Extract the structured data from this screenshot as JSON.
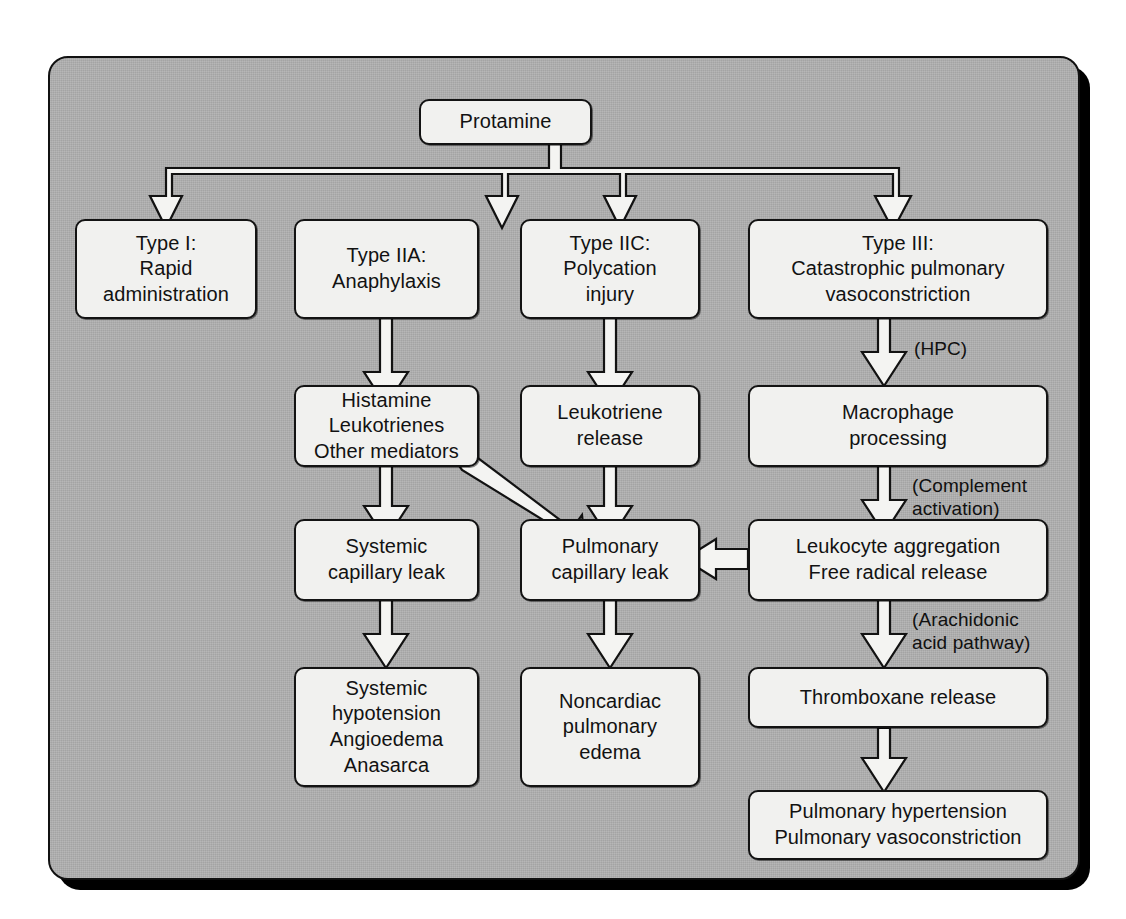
{
  "diagram": {
    "background_color": "#b0b0b0",
    "node_fill_color": "#f1f1ef",
    "line_color": "#131313"
  },
  "nodes": {
    "protamine": "Protamine",
    "type1": "Type I:\nRapid\nadministration",
    "type2a": "Type IIA:\nAnaphylaxis",
    "type2c": "Type IIC:\nPolycation\ninjury",
    "type3": "Type III:\nCatastrophic pulmonary\nvasoconstriction",
    "mediators": "Histamine\nLeukotrienes\nOther mediators",
    "leukotriene_release": "Leukotriene\nrelease",
    "macrophage": "Macrophage\nprocessing",
    "systemic_leak": "Systemic\ncapillary leak",
    "pulmonary_leak": "Pulmonary\ncapillary leak",
    "leukocyte": "Leukocyte aggregation\nFree radical release",
    "systemic_outcome": "Systemic\nhypotension\nAngioedema\nAnasarca",
    "noncardiac_edema": "Noncardiac\npulmonary\nedema",
    "thromboxane": "Thromboxane release",
    "pulmonary_outcome": "Pulmonary hypertension\nPulmonary vasoconstriction"
  },
  "edge_labels": {
    "hpc": "(HPC)",
    "complement": "(Complement\nactivation)",
    "arachidonic": "(Arachidonic\nacid pathway)"
  }
}
